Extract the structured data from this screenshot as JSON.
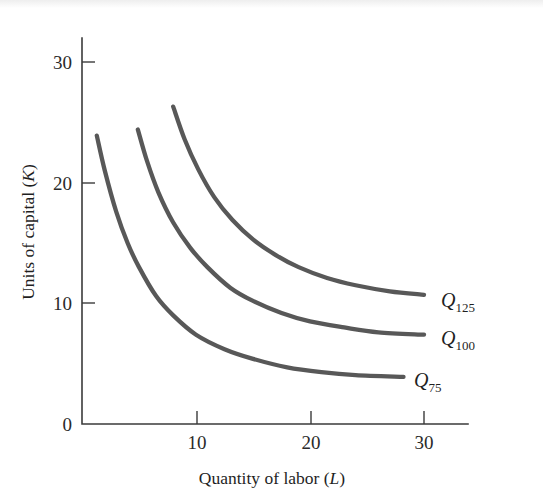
{
  "figure": {
    "background_color": "#ffffff",
    "curve_color": "#585858",
    "axis_color": "#3b3b3b",
    "text_color": "#1f1f1f"
  },
  "axes": {
    "x_title_main": "Quantity of labor (",
    "x_title_var": "L",
    "x_title_close": ")",
    "y_title_main": "Units of capital (",
    "y_title_var": "K",
    "y_title_close": ")",
    "x_ticks": [
      "10",
      "20",
      "30"
    ],
    "y_ticks": [
      "0",
      "10",
      "20",
      "30"
    ]
  },
  "labels": {
    "q125_base": "Q",
    "q125_sub": "125",
    "q100_base": "Q",
    "q100_sub": "100",
    "q75_base": "Q",
    "q75_sub": "75"
  },
  "chart_data": {
    "type": "line",
    "title": "",
    "xlabel": "Quantity of labor (L)",
    "ylabel": "Units of capital (K)",
    "xlim": [
      0,
      34
    ],
    "ylim": [
      0,
      32
    ],
    "xticks": [
      10,
      20,
      30
    ],
    "yticks": [
      0,
      10,
      20,
      30
    ],
    "grid": false,
    "legend": "inline-right-of-curve-ends",
    "series": [
      {
        "name": "Q75",
        "label": "Q_75",
        "color": "#585858",
        "points": [
          {
            "x": 1.3,
            "y": 23.9
          },
          {
            "x": 2.0,
            "y": 21.0
          },
          {
            "x": 3.0,
            "y": 17.6
          },
          {
            "x": 4.0,
            "y": 15.0
          },
          {
            "x": 5.0,
            "y": 13.0
          },
          {
            "x": 6.5,
            "y": 10.6
          },
          {
            "x": 8.0,
            "y": 9.0
          },
          {
            "x": 10.0,
            "y": 7.4
          },
          {
            "x": 12.5,
            "y": 6.2
          },
          {
            "x": 15.0,
            "y": 5.4
          },
          {
            "x": 18.0,
            "y": 4.7
          },
          {
            "x": 21.0,
            "y": 4.3
          },
          {
            "x": 24.0,
            "y": 4.05
          },
          {
            "x": 28.2,
            "y": 3.9
          }
        ]
      },
      {
        "name": "Q100",
        "label": "Q_100",
        "color": "#585858",
        "points": [
          {
            "x": 4.9,
            "y": 24.4
          },
          {
            "x": 5.7,
            "y": 21.8
          },
          {
            "x": 6.7,
            "y": 19.2
          },
          {
            "x": 8.0,
            "y": 16.7
          },
          {
            "x": 9.5,
            "y": 14.6
          },
          {
            "x": 11.0,
            "y": 13.0
          },
          {
            "x": 13.0,
            "y": 11.3
          },
          {
            "x": 15.0,
            "y": 10.2
          },
          {
            "x": 17.5,
            "y": 9.2
          },
          {
            "x": 20.0,
            "y": 8.5
          },
          {
            "x": 23.0,
            "y": 8.0
          },
          {
            "x": 26.0,
            "y": 7.6
          },
          {
            "x": 30.0,
            "y": 7.4
          }
        ]
      },
      {
        "name": "Q125",
        "label": "Q_125",
        "color": "#585858",
        "points": [
          {
            "x": 8.0,
            "y": 26.3
          },
          {
            "x": 9.0,
            "y": 23.6
          },
          {
            "x": 10.2,
            "y": 21.1
          },
          {
            "x": 11.6,
            "y": 18.8
          },
          {
            "x": 13.2,
            "y": 16.9
          },
          {
            "x": 15.0,
            "y": 15.3
          },
          {
            "x": 17.0,
            "y": 14.0
          },
          {
            "x": 19.0,
            "y": 13.0
          },
          {
            "x": 21.5,
            "y": 12.1
          },
          {
            "x": 24.0,
            "y": 11.5
          },
          {
            "x": 27.0,
            "y": 11.0
          },
          {
            "x": 30.0,
            "y": 10.7
          }
        ]
      }
    ],
    "annotations": [
      {
        "text": "Q125",
        "x": 31.5,
        "y": 10.4
      },
      {
        "text": "Q100",
        "x": 31.5,
        "y": 7.2
      },
      {
        "text": "Q75",
        "x": 29.5,
        "y": 3.7
      }
    ]
  }
}
